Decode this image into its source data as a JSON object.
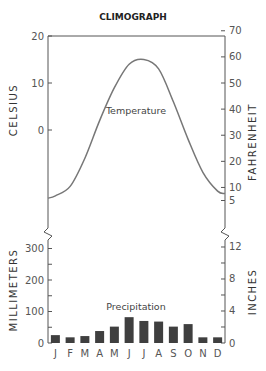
{
  "chart_data": {
    "type": "climograph",
    "title": "CLIMOGRAPH",
    "categories": [
      "J",
      "F",
      "M",
      "A",
      "M",
      "J",
      "J",
      "A",
      "S",
      "O",
      "N",
      "D"
    ],
    "temperature": {
      "label": "Temperature",
      "type": "line",
      "unit_left": "CELSIUS",
      "unit_right": "FAHRENHEIT",
      "values_celsius": [
        -14,
        -12,
        -6,
        2,
        9,
        14,
        15,
        13,
        6,
        -2,
        -9,
        -13
      ],
      "left_ticks": [
        20,
        10,
        0
      ],
      "right_ticks": [
        70,
        60,
        50,
        40,
        30,
        20,
        10,
        5
      ]
    },
    "precipitation": {
      "label": "Precipitation",
      "type": "bar",
      "unit_left": "MILLIMETERS",
      "unit_right": "INCHES",
      "values_mm": [
        25,
        18,
        22,
        38,
        52,
        82,
        70,
        68,
        52,
        60,
        18,
        18
      ],
      "left_ticks": [
        300,
        200,
        100,
        0
      ],
      "right_ticks": [
        12,
        8,
        4,
        0
      ]
    },
    "axis_break": true,
    "grid": false
  }
}
